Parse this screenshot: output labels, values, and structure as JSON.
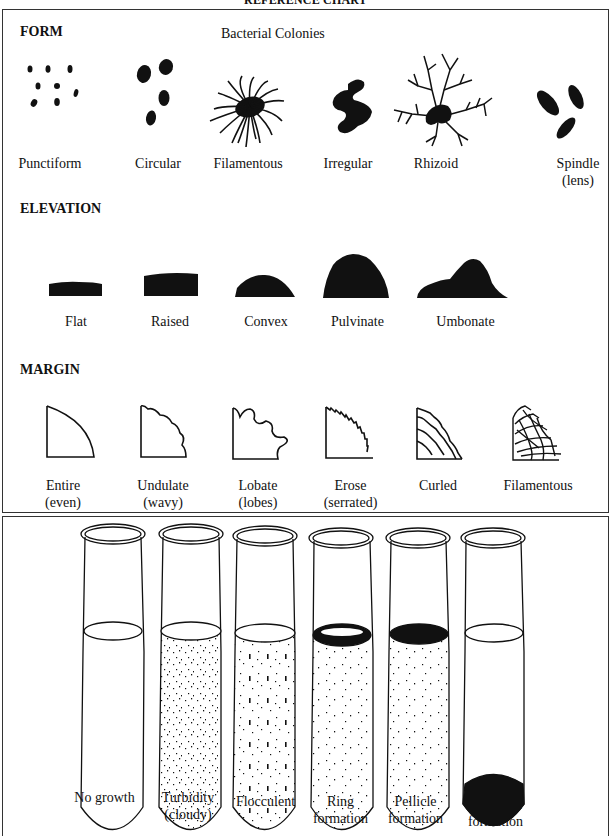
{
  "title": "REFERENCE CHART",
  "colonies": {
    "subtitle": "Bacterial Colonies",
    "form": {
      "heading": "FORM",
      "items": [
        {
          "label": "Punctiform"
        },
        {
          "label": "Circular"
        },
        {
          "label": "Filamentous"
        },
        {
          "label": "Irregular"
        },
        {
          "label": "Rhizoid"
        },
        {
          "label": "Spindle",
          "sub": "(lens)"
        }
      ]
    },
    "elevation": {
      "heading": "ELEVATION",
      "items": [
        {
          "label": "Flat"
        },
        {
          "label": "Raised"
        },
        {
          "label": "Convex"
        },
        {
          "label": "Pulvinate"
        },
        {
          "label": "Umbonate"
        }
      ]
    },
    "margin": {
      "heading": "MARGIN",
      "items": [
        {
          "label": "Entire",
          "sub": "(even)"
        },
        {
          "label": "Undulate",
          "sub": "(wavy)"
        },
        {
          "label": "Lobate",
          "sub": "(lobes)"
        },
        {
          "label": "Erose",
          "sub": "(serrated)"
        },
        {
          "label": "Curled"
        },
        {
          "label": "Filamentous"
        }
      ]
    }
  },
  "broth": {
    "tubes": [
      {
        "label": "No growth"
      },
      {
        "label": "Turbidity",
        "sub": "(cloudy)"
      },
      {
        "label": "Flocculent"
      },
      {
        "label": "Ring",
        "sub": "formation"
      },
      {
        "label": "Pellicle",
        "sub": "formation"
      },
      {
        "label": "Sediment",
        "sub": "formation"
      }
    ]
  }
}
